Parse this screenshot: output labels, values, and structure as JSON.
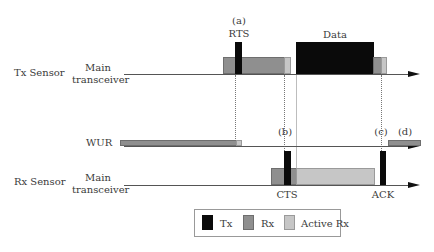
{
  "rows": {
    "tx_sensor": {
      "group_label": "Tx Sensor",
      "channel_label_line1": "Main",
      "channel_label_line2": "transceiver"
    },
    "wur": {
      "channel_label": "WUR"
    },
    "rx_sensor": {
      "group_label": "Rx Sensor",
      "channel_label_line1": "Main",
      "channel_label_line2": "transceiver"
    }
  },
  "events": {
    "a": {
      "marker": "(a)",
      "label": "RTS"
    },
    "b": {
      "marker": "(b)",
      "label": "CTS"
    },
    "c": {
      "marker": "(c)",
      "label": "ACK"
    },
    "d": {
      "marker": "(d)"
    },
    "data": {
      "label": "Data"
    }
  },
  "legend": {
    "items": [
      {
        "label": "Tx",
        "color": "#0a0a0a"
      },
      {
        "label": "Rx",
        "color": "#8f8f8f"
      },
      {
        "label": "Active Rx",
        "color": "#c6c6c6"
      }
    ]
  }
}
